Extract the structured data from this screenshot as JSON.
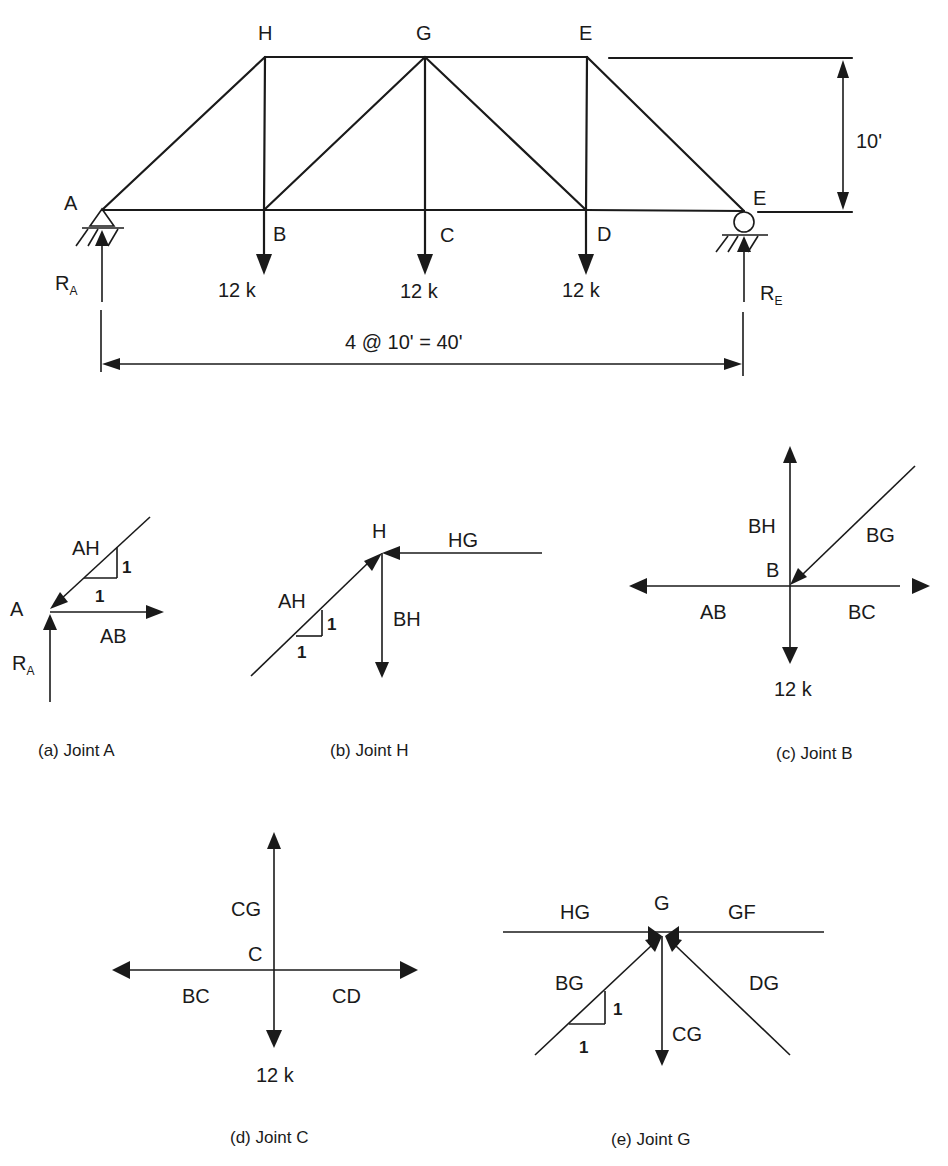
{
  "truss": {
    "nodes": {
      "A": {
        "label": "A"
      },
      "B": {
        "label": "B"
      },
      "C": {
        "label": "C"
      },
      "D": {
        "label": "D"
      },
      "E": {
        "label": "E"
      },
      "H": {
        "label": "H"
      },
      "G": {
        "label": "G"
      },
      "F": {
        "label": "E"
      }
    },
    "members": [
      [
        "A",
        "B"
      ],
      [
        "B",
        "C"
      ],
      [
        "C",
        "D"
      ],
      [
        "D",
        "E"
      ],
      [
        "H",
        "G"
      ],
      [
        "G",
        "F"
      ],
      [
        "A",
        "H"
      ],
      [
        "H",
        "B"
      ],
      [
        "B",
        "G"
      ],
      [
        "G",
        "C"
      ],
      [
        "G",
        "D"
      ],
      [
        "F",
        "D"
      ],
      [
        "F",
        "E"
      ]
    ],
    "loads": [
      {
        "node": "B",
        "label": "12 k"
      },
      {
        "node": "C",
        "label": "12 k"
      },
      {
        "node": "D",
        "label": "12 k"
      }
    ],
    "reactions": {
      "left": {
        "label": "R",
        "sub": "A",
        "support": "pin"
      },
      "right": {
        "label": "R",
        "sub": "E",
        "support": "roller"
      }
    },
    "height_dimension": "10'",
    "span_dimension": "4 @ 10' = 40'"
  },
  "joints": [
    {
      "id": "a",
      "caption": "(a) Joint A",
      "joint_label": "A",
      "members": [
        {
          "label": "AH",
          "direction": "toward-joint",
          "angle_deg": 45
        },
        {
          "label": "AB",
          "direction": "away-from-joint",
          "angle_deg": 0
        }
      ],
      "reaction": {
        "label": "R",
        "sub": "A"
      },
      "slope": {
        "rise": "1",
        "run": "1"
      }
    },
    {
      "id": "b",
      "caption": "(b) Joint H",
      "joint_label": "H",
      "members": [
        {
          "label": "AH",
          "direction": "toward-joint",
          "angle_deg": 225
        },
        {
          "label": "HG",
          "direction": "toward-joint",
          "angle_deg": 0
        },
        {
          "label": "BH",
          "direction": "away-from-joint",
          "angle_deg": 270
        }
      ],
      "slope": {
        "rise": "1",
        "run": "1"
      }
    },
    {
      "id": "c",
      "caption": "(c) Joint B",
      "joint_label": "B",
      "members": [
        {
          "label": "BH",
          "direction": "away-from-joint",
          "angle_deg": 90
        },
        {
          "label": "BG",
          "direction": "toward-joint",
          "angle_deg": 45
        },
        {
          "label": "AB",
          "direction": "away-from-joint",
          "angle_deg": 180
        },
        {
          "label": "BC",
          "direction": "away-from-joint",
          "angle_deg": 0
        }
      ],
      "load": "12 k"
    },
    {
      "id": "d",
      "caption": "(d) Joint C",
      "joint_label": "C",
      "members": [
        {
          "label": "CG",
          "direction": "away-from-joint",
          "angle_deg": 90
        },
        {
          "label": "BC",
          "direction": "away-from-joint",
          "angle_deg": 180
        },
        {
          "label": "CD",
          "direction": "away-from-joint",
          "angle_deg": 0
        }
      ],
      "load": "12 k"
    },
    {
      "id": "e",
      "caption": "(e) Joint G",
      "joint_label": "G",
      "members": [
        {
          "label": "HG",
          "direction": "line",
          "angle_deg": 180
        },
        {
          "label": "GF",
          "direction": "line",
          "angle_deg": 0
        },
        {
          "label": "BG",
          "direction": "toward-joint",
          "angle_deg": 225
        },
        {
          "label": "DG",
          "direction": "toward-joint",
          "angle_deg": 315
        },
        {
          "label": "CG",
          "direction": "away-from-joint",
          "angle_deg": 270
        }
      ],
      "slope": {
        "rise": "1",
        "run": "1"
      }
    }
  ]
}
